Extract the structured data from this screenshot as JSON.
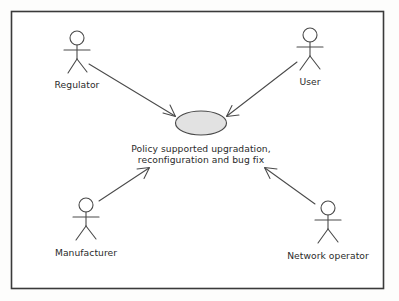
{
  "diagram": {
    "kind": "uml-use-case-diagram",
    "frame": {
      "label": "system-boundary",
      "stroke_color": "#3a3a3a",
      "fill_color": "#ffffff",
      "x": 11,
      "y": 11,
      "width": 373,
      "height": 278
    },
    "canvas_background": "#fdfdfc",
    "line_color": "#4a4a4a",
    "text_color": "#2b2b2b",
    "usecase": {
      "name": "policy-supported-upgradation",
      "label_line1": "Policy supported upgradation,",
      "label_line2": "reconfiguration and bug fix",
      "fill_color": "#e2e2e2",
      "stroke_color": "#4a4a4a",
      "cx": 201,
      "cy": 123,
      "rx": 25,
      "ry": 12
    },
    "actors": [
      {
        "name": "regulator",
        "label": "Regulator",
        "head_cx": 77,
        "head_cy": 38,
        "head_r": 7,
        "label_x": 77,
        "label_y": 87,
        "label_anchor": "middle"
      },
      {
        "name": "user",
        "label": "User",
        "head_cx": 309,
        "head_cy": 35,
        "head_r": 7,
        "label_x": 309,
        "label_y": 84,
        "label_anchor": "middle"
      },
      {
        "name": "manufacturer",
        "label": "Manufacturer",
        "head_cx": 86,
        "head_cy": 204,
        "head_r": 7,
        "label_x": 86,
        "label_y": 255,
        "label_anchor": "middle"
      },
      {
        "name": "network-operator",
        "label": "Network operator",
        "head_cx": 328,
        "head_cy": 207,
        "head_r": 7,
        "label_x": 328,
        "label_y": 258,
        "label_anchor": "middle"
      }
    ],
    "associations": [
      {
        "name": "regulator-to-usecase",
        "from": "regulator",
        "to": "usecase",
        "x1": 89,
        "y1": 64,
        "x2": 176,
        "y2": 117
      },
      {
        "name": "user-to-usecase",
        "from": "user",
        "to": "usecase",
        "x1": 296,
        "y1": 62,
        "x2": 226,
        "y2": 116
      },
      {
        "name": "manufacturer-to-usecase",
        "from": "manufacturer",
        "to": "usecase",
        "x1": 99,
        "y1": 200,
        "x2": 149,
        "y2": 169
      },
      {
        "name": "network-operator-to-usecase",
        "from": "network-operator",
        "to": "usecase",
        "x1": 315,
        "y1": 203,
        "x2": 265,
        "y2": 169
      }
    ]
  }
}
